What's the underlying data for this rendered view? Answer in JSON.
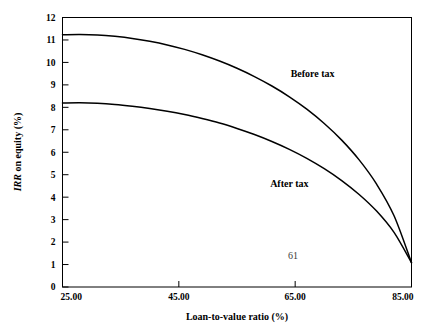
{
  "chart_data": {
    "type": "line",
    "title": "",
    "xlabel": "Loan-to-value ratio (%)",
    "ylabel": "IRR on equity (%)",
    "ylabel_emphasis": "IRR",
    "ylabel_rest": " on equity (%)",
    "xlim": [
      25.0,
      85.0
    ],
    "ylim": [
      0,
      12
    ],
    "xticks": [
      25.0,
      45.0,
      65.0,
      85.0
    ],
    "xtick_labels": [
      "25.00",
      "45.00",
      "65.00",
      "85.00"
    ],
    "yticks": [
      0,
      1,
      2,
      3,
      4,
      5,
      6,
      7,
      8,
      9,
      10,
      11,
      12
    ],
    "ytick_labels": [
      "0",
      "1",
      "2",
      "3",
      "4",
      "5",
      "6",
      "7",
      "8",
      "9",
      "10",
      "11",
      "12"
    ],
    "grid": false,
    "legend": "inline-annotations",
    "series": [
      {
        "name": "Before tax",
        "annotation": "Before tax",
        "annotation_x": 68.0,
        "annotation_y": 9.35,
        "x": [
          25.0,
          28.0,
          31.0,
          34.0,
          37.0,
          40.0,
          43.0,
          46.0,
          49.0,
          52.0,
          55.0,
          58.0,
          61.0,
          64.0,
          67.0,
          70.0,
          73.0,
          76.0,
          79.0,
          82.0,
          85.0
        ],
        "values": [
          11.23,
          11.24,
          11.22,
          11.16,
          11.07,
          10.94,
          10.78,
          10.58,
          10.34,
          10.06,
          9.74,
          9.37,
          8.95,
          8.47,
          7.92,
          7.28,
          6.54,
          5.66,
          4.58,
          3.17,
          1.08
        ]
      },
      {
        "name": "After tax",
        "annotation": "After tax",
        "annotation_x": 64.0,
        "annotation_y": 4.45,
        "x": [
          25.0,
          28.0,
          31.0,
          34.0,
          37.0,
          40.0,
          43.0,
          46.0,
          49.0,
          52.0,
          55.0,
          58.0,
          61.0,
          64.0,
          67.0,
          70.0,
          73.0,
          76.0,
          79.0,
          82.0,
          85.0
        ],
        "values": [
          8.19,
          8.2,
          8.18,
          8.13,
          8.05,
          7.95,
          7.83,
          7.68,
          7.5,
          7.3,
          7.06,
          6.79,
          6.48,
          6.13,
          5.73,
          5.27,
          4.74,
          4.12,
          3.38,
          2.43,
          1.08
        ]
      }
    ],
    "page_number": "61"
  },
  "colors": {
    "curve": "#000000",
    "axis": "#000000",
    "background": "#ffffff",
    "page_number": "#3a3a3a"
  }
}
